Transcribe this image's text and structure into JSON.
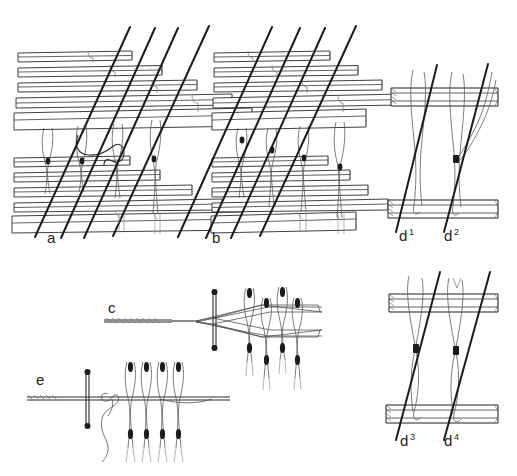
{
  "plate": {
    "title": "Weaving heddle and loom thread construction diagram",
    "width": 517,
    "height": 476,
    "background_color": "#ffffff",
    "ink_color": "#1d1d1d",
    "light_ink_color": "#555555",
    "hairline_color": "#7a7a7a",
    "style": "hand-drawn technical line illustration, pen and ink"
  },
  "figures": [
    {
      "id": "a",
      "label": "a",
      "label_x": 47,
      "label_y": 243,
      "caption_text": "a",
      "description": "Stepped stack of warp bars, upper and lower, with four diagonal threads and a curved hooked loop thread in the middle register",
      "has_curved_loop": true,
      "bar_count_upper": 5,
      "bar_count_lower": 5,
      "diagonal_count": 4
    },
    {
      "id": "b",
      "label": "b",
      "label_x": 212,
      "label_y": 243,
      "caption_text": "b",
      "description": "Stepped stack of warp bars, upper and lower, with four diagonal threads, straight vertical heddle loops, no curved hook",
      "has_curved_loop": false,
      "bar_count_upper": 5,
      "bar_count_lower": 5,
      "diagonal_count": 4
    },
    {
      "id": "c",
      "label": "c",
      "label_x": 108,
      "label_y": 313,
      "caption_text": "c",
      "description": "Horizontal cord with lashed end, crossed by a vertical rod; threads fan out in a lozenge to four pairs of vertical heddle loops with knots"
    },
    {
      "id": "d1",
      "label": "d",
      "superscript": "1",
      "label_x": 399,
      "label_y": 241,
      "caption_text": "d¹",
      "description": "Two horizontal beams with a vertical heddle loop and a diagonal thread passing through"
    },
    {
      "id": "d2",
      "label": "d",
      "superscript": "2",
      "label_x": 444,
      "label_y": 241,
      "caption_text": "d²",
      "description": "Two horizontal beams with a vertical heddle loop bound by a knot to a diagonal thread"
    },
    {
      "id": "d3",
      "label": "d",
      "superscript": "3",
      "label_x": 400,
      "label_y": 446,
      "caption_text": "d³",
      "description": "Two horizontal beams with a crossed heddle loop knotted at mid-height to a diagonal thread"
    },
    {
      "id": "d4",
      "label": "d",
      "superscript": "4",
      "label_x": 444,
      "label_y": 446,
      "caption_text": "d⁴",
      "description": "Two horizontal beams with a crossed heddle loop knotted at mid-height to a diagonal thread"
    },
    {
      "id": "e",
      "label": "e",
      "label_x": 36,
      "label_y": 385,
      "caption_text": "e",
      "description": "Horizontal cord with lashed end crossed by a short vertical rod, a trailing sinuous loose thread, and four vertical heddle loops with knots"
    }
  ]
}
